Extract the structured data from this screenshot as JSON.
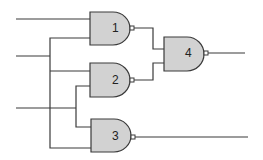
{
  "diagram": {
    "type": "logic-circuit",
    "gate_type": "NAND",
    "colors": {
      "gate_fill": "#d2d2d2",
      "stroke": "#3a3a3a",
      "background": "#ffffff"
    },
    "gates": [
      {
        "id": "1",
        "label": "1"
      },
      {
        "id": "2",
        "label": "2"
      },
      {
        "id": "3",
        "label": "3"
      },
      {
        "id": "4",
        "label": "4"
      }
    ]
  }
}
